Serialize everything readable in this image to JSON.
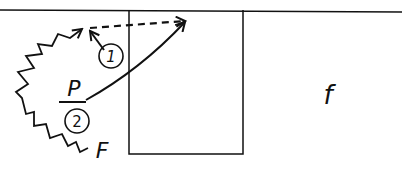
{
  "diagram": {
    "labels": {
      "point": "P",
      "path_1": "1",
      "path_2": "2",
      "start_label": "F",
      "region_label": "f"
    },
    "colors": {
      "ink": "#111111",
      "background": "#ffffff"
    },
    "elements": [
      {
        "type": "top-boundary-line"
      },
      {
        "type": "box"
      },
      {
        "type": "zigzag-arrow",
        "label": "F"
      },
      {
        "type": "dashed-arrow"
      },
      {
        "type": "curved-arrow-from-P"
      },
      {
        "type": "short-arrow",
        "label": "1"
      },
      {
        "type": "bar-under-P",
        "label": "2"
      }
    ]
  }
}
